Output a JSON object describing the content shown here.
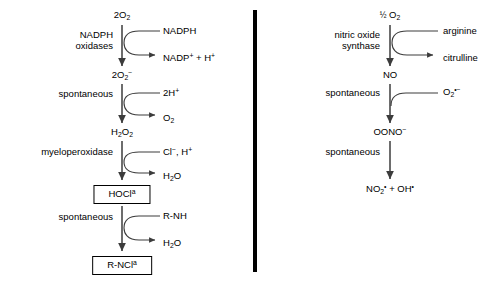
{
  "figure": {
    "divider": {
      "name": "panel-divider",
      "x": 253,
      "y": 10,
      "width": 4,
      "height": 262,
      "color": "#000000"
    },
    "stroke_color": "#3c3c3c",
    "text_color": "#000000"
  },
  "panels": [
    {
      "id": "left",
      "name": "ros-pathway-panel",
      "title": "Reactive oxygen species pathway",
      "spine_x": 122,
      "species": [
        {
          "name": "species-2o2",
          "html": "2O<sub>2</sub>",
          "plain": "2O2",
          "x": 122,
          "y": 10
        },
        {
          "name": "species-2o2-rad",
          "html": "2O<sub>2</sub><sup>&#8722;</sup>",
          "plain": "2O2-",
          "x": 122,
          "y": 70
        },
        {
          "name": "species-h2o2",
          "html": "H<sub>2</sub>O<sub>2</sub>",
          "plain": "H2O2",
          "x": 122,
          "y": 127
        },
        {
          "name": "species-hocl",
          "html": "HOCl<sup>a</sup>",
          "plain": "HOCla",
          "x": 122,
          "y": 185,
          "boxed": true
        },
        {
          "name": "species-rncl",
          "html": "R-NCl<sup>a</sup>",
          "plain": "R-NCla",
          "x": 122,
          "y": 256,
          "boxed": true
        }
      ],
      "enzymes": [
        {
          "name": "enzyme-nadph-oxidases",
          "lines": [
            "NADPH",
            "oxidases"
          ],
          "x": 113,
          "y": 30
        },
        {
          "name": "enzyme-spontaneous-1",
          "lines": [
            "spontaneous"
          ],
          "x": 113,
          "y": 89
        },
        {
          "name": "enzyme-myeloperoxidase",
          "lines": [
            "myeloperoxidase"
          ],
          "x": 113,
          "y": 147
        },
        {
          "name": "enzyme-spontaneous-2",
          "lines": [
            "spontaneous"
          ],
          "x": 113,
          "y": 212
        }
      ],
      "substrates": [
        {
          "name": "substrate-nadph",
          "html": "NADPH",
          "plain": "NADPH",
          "x": 163,
          "y": 26
        },
        {
          "name": "substrate-2h",
          "html": "2H<sup>+</sup>",
          "plain": "2H+",
          "x": 163,
          "y": 88
        },
        {
          "name": "substrate-cl-h",
          "html": "Cl<sup>&#8722;</sup>, H<sup>+</sup>",
          "plain": "Cl-, H+",
          "x": 163,
          "y": 147
        },
        {
          "name": "substrate-rnh",
          "html": "R-NH",
          "plain": "R-NH",
          "x": 163,
          "y": 211
        }
      ],
      "products": [
        {
          "name": "product-nadp-h",
          "html": "NADP<sup>+</sup> + H<sup>+</sup>",
          "plain": "NADP+ + H+",
          "x": 163,
          "y": 53
        },
        {
          "name": "product-o2",
          "html": "O<sub>2</sub>",
          "plain": "O2",
          "x": 163,
          "y": 113
        },
        {
          "name": "product-h2o-1",
          "html": "H<sub>2</sub>O",
          "plain": "H2O",
          "x": 163,
          "y": 171
        },
        {
          "name": "product-h2o-2",
          "html": "H<sub>2</sub>O",
          "plain": "H2O",
          "x": 163,
          "y": 238
        }
      ],
      "reactions": [
        {
          "name": "reaction-arrow-nadph-oxidase",
          "from": "2O2",
          "to": "2O2-",
          "has_curve": true
        },
        {
          "name": "reaction-arrow-dismutation",
          "from": "2O2-",
          "to": "H2O2",
          "has_curve": true
        },
        {
          "name": "reaction-arrow-myeloperoxidase",
          "from": "H2O2",
          "to": "HOCla",
          "has_curve": true
        },
        {
          "name": "reaction-arrow-chloramine",
          "from": "HOCla",
          "to": "R-NCla",
          "has_curve": true
        }
      ]
    },
    {
      "id": "right",
      "name": "rns-pathway-panel",
      "title": "Reactive nitrogen species pathway",
      "spine_x": 390,
      "species": [
        {
          "name": "species-half-o2",
          "html": "<span class=\"frac\">&#189;</span> O<sub>2</sub>",
          "plain": "1/2 O2",
          "x": 390,
          "y": 10
        },
        {
          "name": "species-no",
          "html": "NO",
          "plain": "NO",
          "x": 390,
          "y": 70
        },
        {
          "name": "species-oono",
          "html": "OONO<sup>&#8722;</sup>",
          "plain": "OONO-",
          "x": 390,
          "y": 127
        },
        {
          "name": "species-no2-oh",
          "html": "NO<sub>2</sub><sup>&#8226;</sup> + OH<sup>&#8226;</sup>",
          "plain": "NO2. + OH.",
          "x": 390,
          "y": 184
        }
      ],
      "enzymes": [
        {
          "name": "enzyme-nitric-oxide-synthase",
          "lines": [
            "nitric oxide",
            "synthase"
          ],
          "x": 380,
          "y": 30
        },
        {
          "name": "enzyme-spontaneous-3",
          "lines": [
            "spontaneous"
          ],
          "x": 380,
          "y": 88
        },
        {
          "name": "enzyme-spontaneous-4",
          "lines": [
            "spontaneous"
          ],
          "x": 380,
          "y": 147
        }
      ],
      "substrates": [
        {
          "name": "substrate-arginine",
          "html": "arginine",
          "plain": "arginine",
          "x": 443,
          "y": 26
        },
        {
          "name": "substrate-o2-rad",
          "html": "O<sub>2</sub><sup>&#8226;&#8722;</sup>",
          "plain": "O2.-",
          "x": 443,
          "y": 87
        }
      ],
      "products": [
        {
          "name": "product-citrulline",
          "html": "citrulline",
          "plain": "citrulline",
          "x": 443,
          "y": 53
        }
      ],
      "reactions": [
        {
          "name": "reaction-arrow-nos",
          "from": "1/2 O2",
          "to": "NO",
          "has_curve": true
        },
        {
          "name": "reaction-arrow-peroxynitrite",
          "from": "NO",
          "to": "OONO-",
          "has_curve": true
        },
        {
          "name": "reaction-arrow-decomposition",
          "from": "OONO-",
          "to": "NO2. + OH.",
          "has_curve": false
        }
      ]
    }
  ]
}
